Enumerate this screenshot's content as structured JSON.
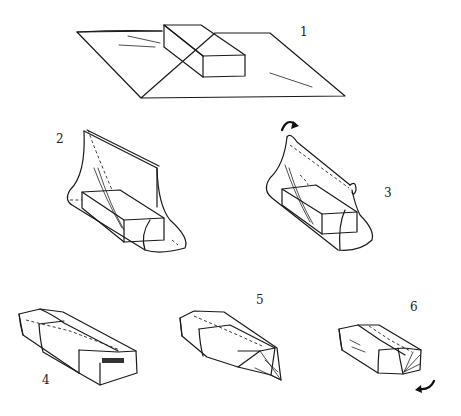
{
  "diagram": {
    "steps": [
      {
        "number": "1",
        "description": "Box placed diagonally on a sheet of paper"
      },
      {
        "number": "2",
        "description": "Paper brought up on both sides of the box and held together above it"
      },
      {
        "number": "3",
        "description": "Top edges folded over together, rotating down"
      },
      {
        "number": "4",
        "description": "Long seam folded down flat and taped on top of the box"
      },
      {
        "number": "5",
        "description": "Ends pinched into a pointed flap"
      },
      {
        "number": "6",
        "description": "End flap folded under the box"
      }
    ],
    "icons": {
      "step3": "curved-arrow-icon",
      "step6": "curved-arrow-icon"
    },
    "colors": {
      "ink": "#1a1a1a",
      "background": "#ffffff"
    }
  }
}
